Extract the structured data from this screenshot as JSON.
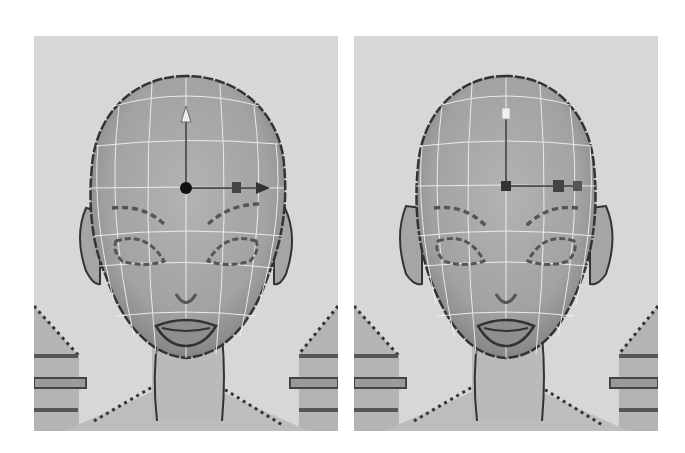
{
  "figure": {
    "background": "#ffffff",
    "panels": [
      {
        "id": "left",
        "label": "",
        "viewport_color": "#d7d7d7",
        "manipulator": {
          "type": "move-tool",
          "center_handle": "sphere",
          "y_axis_tip": "arrow",
          "x_axis_tip": "arrow",
          "plane_handle": "square"
        },
        "mesh": "head-wireframe-on-shaded",
        "state": "vertices-not-symmetrical"
      },
      {
        "id": "right",
        "label": "",
        "viewport_color": "#d7d7d7",
        "manipulator": {
          "type": "scale-tool",
          "center_handle": "square",
          "y_axis_tip": "cube",
          "x_axis_tip": "cube",
          "plane_handle": "square"
        },
        "mesh": "head-wireframe-on-shaded",
        "state": "vertices-symmetrical"
      }
    ],
    "colors": {
      "skin": "#a9a9a9",
      "skin_shadow": "#8d8d8d",
      "outline": "#3a3a3a",
      "wire": "#f2f2f2",
      "shoulder": "#b4b4b4",
      "neck": "#b9b9b9"
    }
  }
}
